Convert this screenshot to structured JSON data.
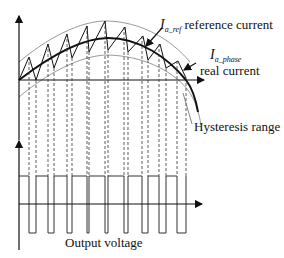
{
  "diagram": {
    "labels": {
      "ref_symbol": "I",
      "ref_subscript": "a_ref",
      "ref_text": "reference current",
      "phase_symbol": "I",
      "phase_subscript": "a_phase",
      "phase_text": "real current",
      "hysteresis": "Hysteresis range",
      "output": "Output voltage"
    },
    "colors": {
      "line": "#111111",
      "band": "#9a9a9a",
      "dash": "#333333"
    },
    "current_waveform": {
      "peaks": [
        [
          29,
          57
        ],
        [
          48,
          44
        ],
        [
          67,
          34
        ],
        [
          87,
          26
        ],
        [
          105,
          21
        ],
        [
          125,
          27
        ],
        [
          143,
          36
        ],
        [
          160,
          44
        ],
        [
          178,
          61
        ]
      ],
      "troughs": [
        [
          36,
          80
        ],
        [
          54,
          68
        ],
        [
          72,
          58
        ],
        [
          89,
          52
        ],
        [
          108,
          50
        ],
        [
          128,
          52
        ],
        [
          148,
          60
        ],
        [
          166,
          68
        ],
        [
          186,
          78
        ]
      ]
    },
    "pulses": [
      [
        29,
        36
      ],
      [
        48,
        54
      ],
      [
        67,
        72
      ],
      [
        87,
        89
      ],
      [
        105,
        108
      ],
      [
        124,
        128
      ],
      [
        142,
        148
      ],
      [
        159,
        166
      ],
      [
        177,
        186
      ]
    ]
  }
}
